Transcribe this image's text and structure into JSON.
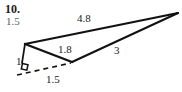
{
  "figure": {
    "problem_number": "10.",
    "extra_label": "1.5",
    "background_color": "#ffffff",
    "stroke_color": "#111111",
    "muted_text_color": "#5d5d5d",
    "type": "geometry-triangle-diagram",
    "vertices": {
      "left": [
        25,
        44
      ],
      "right_apex": [
        178,
        13
      ],
      "bottom": [
        72,
        62
      ],
      "foot": [
        22,
        72
      ]
    },
    "edges": [
      {
        "name": "top-edge",
        "from": "left",
        "to": "right_apex",
        "label": "4.8",
        "style": "solid"
      },
      {
        "name": "middle-edge",
        "from": "left",
        "to": "bottom",
        "label": "1.8",
        "style": "solid"
      },
      {
        "name": "lower-right-edge",
        "from": "bottom",
        "to": "right_apex",
        "label": "3",
        "style": "solid"
      },
      {
        "name": "altitude-segment",
        "from": "left",
        "to": "foot",
        "label": "1",
        "style": "solid"
      },
      {
        "name": "base-dashed",
        "from": "foot",
        "to": "bottom",
        "label": "1.5",
        "style": "dashed"
      }
    ],
    "right_angle_marker": {
      "name": "right-angle-mark",
      "at": [
        26,
        68
      ]
    },
    "labels": {
      "top": "4.8",
      "middle": "1.8",
      "lower_right": "3",
      "short_side": "1",
      "base": "1.5"
    }
  }
}
